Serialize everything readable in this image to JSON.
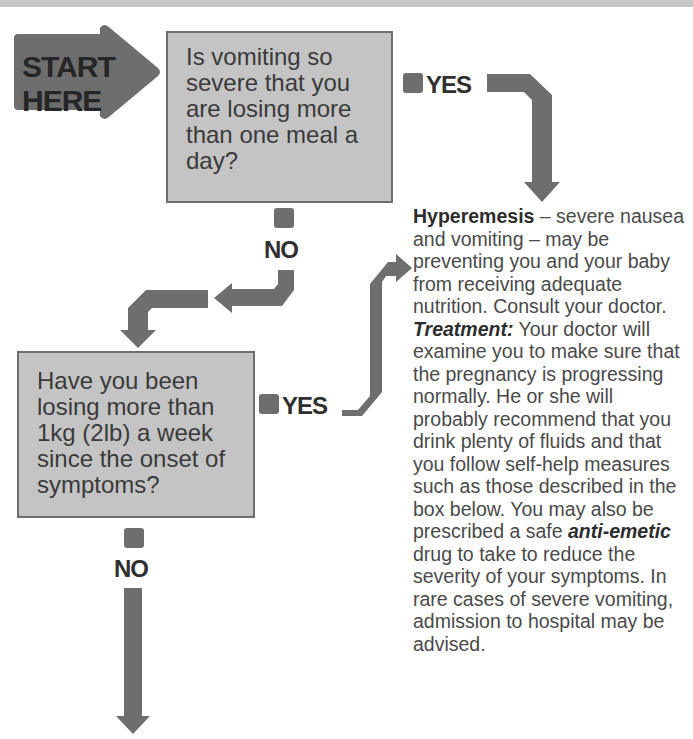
{
  "header_bar": {
    "color": "#c6c6c6"
  },
  "colors": {
    "arrow": "#6e6e6e",
    "question_box_fill": "#c4c4c4",
    "question_box_border": "#6d6d6d",
    "text": "#3a3a3a"
  },
  "start": {
    "line1": "START",
    "line2": "HERE"
  },
  "question1": {
    "lines": [
      "Is vomiting so",
      "severe that you",
      "are losing more",
      "than one meal a",
      "day?"
    ],
    "yes_label": "YES",
    "no_label": "NO"
  },
  "question2": {
    "lines": [
      "Have you been",
      "losing more than",
      "1kg (2lb) a week",
      "since the onset of",
      "symptoms?"
    ],
    "yes_label": "YES",
    "no_label": "NO"
  },
  "diagnosis": {
    "title": "Hyperemesis",
    "title_rest": " – severe nausea and vomiting – may be preventing you and your baby from receiving adequate nutrition. Consult your doctor.",
    "treatment_label": "Treatment:",
    "treatment_text_1": " Your doctor will examine you to make sure that the pregnancy is progressing normally. He or she will probably recommend that you drink plenty of fluids and that you follow self-help measures such as those described in the box below. You may also be prescribed a safe ",
    "treatment_term": "anti-emetic",
    "treatment_text_2": " drug to take to reduce the severity of your symptoms. In rare cases of severe vomiting, admission to hospital may be advised."
  }
}
